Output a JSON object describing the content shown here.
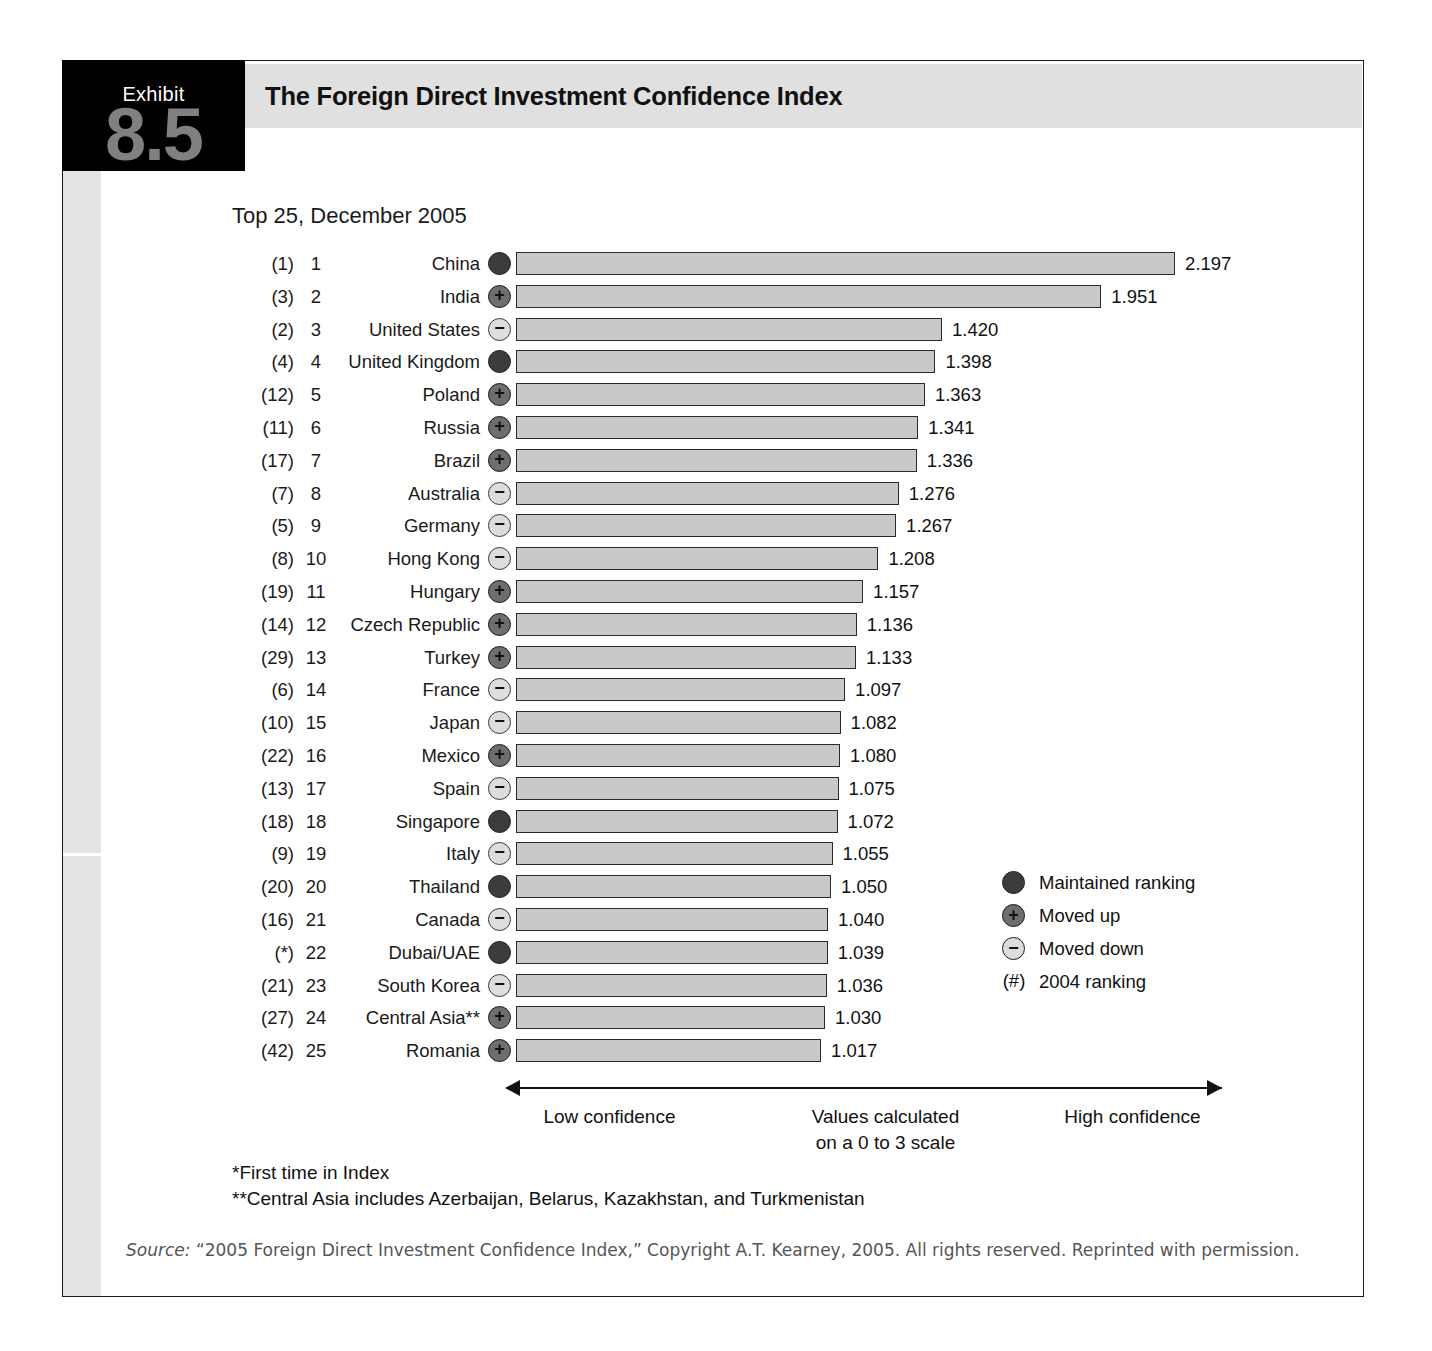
{
  "exhibit": {
    "label": "Exhibit",
    "number": "8.5",
    "title": "The Foreign Direct Investment Confidence Index"
  },
  "subtitle": "Top 25, December 2005",
  "legend": [
    {
      "icon": "filled-circle-icon",
      "type": "same",
      "glyph": "",
      "text": "Maintained ranking"
    },
    {
      "icon": "plus-circle-icon",
      "type": "up",
      "glyph": "+",
      "text": "Moved up"
    },
    {
      "icon": "minus-circle-icon",
      "type": "down",
      "glyph": "−",
      "text": "Moved down"
    },
    {
      "icon": "hash-paren-icon",
      "type": "hash",
      "glyph": "(#)",
      "text": "2004 ranking"
    }
  ],
  "axis": {
    "low": "Low confidence",
    "middle": "Values calculated\non a 0 to 3 scale",
    "middle_line1": "Values calculated",
    "middle_line2": "on a 0 to 3 scale",
    "high": "High confidence"
  },
  "footnotes": [
    "*First time in Index",
    "**Central Asia includes Azerbaijan, Belarus, Kazakhstan, and Turkmenistan"
  ],
  "source": "Source: “2005 Foreign Direct Investment Confidence Index,” Copyright A.T. Kearney, 2005. All rights reserved. Reprinted with permission.",
  "source_prefix": "Source:",
  "source_rest": " “2005 Foreign Direct Investment Confidence Index,” Copyright A.T. Kearney, 2005. All rights reserved. Reprinted with permission.",
  "chart_data": {
    "type": "bar",
    "orientation": "horizontal",
    "title": "The Foreign Direct Investment Confidence Index",
    "subtitle": "Top 25, December 2005",
    "xlabel": "Values calculated on a 0 to 3 scale",
    "ylabel": "",
    "xlim": [
      0,
      3
    ],
    "grid": false,
    "legend_position": "right",
    "categories": [
      "China",
      "India",
      "United States",
      "United Kingdom",
      "Poland",
      "Russia",
      "Brazil",
      "Australia",
      "Germany",
      "Hong Kong",
      "Hungary",
      "Czech Republic",
      "Turkey",
      "France",
      "Japan",
      "Mexico",
      "Spain",
      "Singapore",
      "Italy",
      "Thailand",
      "Canada",
      "Dubai/UAE",
      "South Korea",
      "Central Asia**",
      "Romania"
    ],
    "values": [
      2.197,
      1.951,
      1.42,
      1.398,
      1.363,
      1.341,
      1.336,
      1.276,
      1.267,
      1.208,
      1.157,
      1.136,
      1.133,
      1.097,
      1.082,
      1.08,
      1.075,
      1.072,
      1.055,
      1.05,
      1.04,
      1.039,
      1.036,
      1.03,
      1.017
    ],
    "rows": [
      {
        "prev": "(1)",
        "rank": "1",
        "country": "China",
        "marker": "same",
        "value": 2.197,
        "value_label": "2.197"
      },
      {
        "prev": "(3)",
        "rank": "2",
        "country": "India",
        "marker": "up",
        "value": 1.951,
        "value_label": "1.951"
      },
      {
        "prev": "(2)",
        "rank": "3",
        "country": "United States",
        "marker": "down",
        "value": 1.42,
        "value_label": "1.420"
      },
      {
        "prev": "(4)",
        "rank": "4",
        "country": "United Kingdom",
        "marker": "same",
        "value": 1.398,
        "value_label": "1.398"
      },
      {
        "prev": "(12)",
        "rank": "5",
        "country": "Poland",
        "marker": "up",
        "value": 1.363,
        "value_label": "1.363"
      },
      {
        "prev": "(11)",
        "rank": "6",
        "country": "Russia",
        "marker": "up",
        "value": 1.341,
        "value_label": "1.341"
      },
      {
        "prev": "(17)",
        "rank": "7",
        "country": "Brazil",
        "marker": "up",
        "value": 1.336,
        "value_label": "1.336"
      },
      {
        "prev": "(7)",
        "rank": "8",
        "country": "Australia",
        "marker": "down",
        "value": 1.276,
        "value_label": "1.276"
      },
      {
        "prev": "(5)",
        "rank": "9",
        "country": "Germany",
        "marker": "down",
        "value": 1.267,
        "value_label": "1.267"
      },
      {
        "prev": "(8)",
        "rank": "10",
        "country": "Hong Kong",
        "marker": "down",
        "value": 1.208,
        "value_label": "1.208"
      },
      {
        "prev": "(19)",
        "rank": "11",
        "country": "Hungary",
        "marker": "up",
        "value": 1.157,
        "value_label": "1.157"
      },
      {
        "prev": "(14)",
        "rank": "12",
        "country": "Czech Republic",
        "marker": "up",
        "value": 1.136,
        "value_label": "1.136"
      },
      {
        "prev": "(29)",
        "rank": "13",
        "country": "Turkey",
        "marker": "up",
        "value": 1.133,
        "value_label": "1.133"
      },
      {
        "prev": "(6)",
        "rank": "14",
        "country": "France",
        "marker": "down",
        "value": 1.097,
        "value_label": "1.097"
      },
      {
        "prev": "(10)",
        "rank": "15",
        "country": "Japan",
        "marker": "down",
        "value": 1.082,
        "value_label": "1.082"
      },
      {
        "prev": "(22)",
        "rank": "16",
        "country": "Mexico",
        "marker": "up",
        "value": 1.08,
        "value_label": "1.080"
      },
      {
        "prev": "(13)",
        "rank": "17",
        "country": "Spain",
        "marker": "down",
        "value": 1.075,
        "value_label": "1.075"
      },
      {
        "prev": "(18)",
        "rank": "18",
        "country": "Singapore",
        "marker": "same",
        "value": 1.072,
        "value_label": "1.072"
      },
      {
        "prev": "(9)",
        "rank": "19",
        "country": "Italy",
        "marker": "down",
        "value": 1.055,
        "value_label": "1.055"
      },
      {
        "prev": "(20)",
        "rank": "20",
        "country": "Thailand",
        "marker": "same",
        "value": 1.05,
        "value_label": "1.050"
      },
      {
        "prev": "(16)",
        "rank": "21",
        "country": "Canada",
        "marker": "down",
        "value": 1.04,
        "value_label": "1.040"
      },
      {
        "prev": "(*)",
        "rank": "22",
        "country": "Dubai/UAE",
        "marker": "same",
        "value": 1.039,
        "value_label": "1.039"
      },
      {
        "prev": "(21)",
        "rank": "23",
        "country": "South Korea",
        "marker": "down",
        "value": 1.036,
        "value_label": "1.036"
      },
      {
        "prev": "(27)",
        "rank": "24",
        "country": "Central Asia**",
        "marker": "up",
        "value": 1.03,
        "value_label": "1.030"
      },
      {
        "prev": "(42)",
        "rank": "25",
        "country": "Romania",
        "marker": "up",
        "value": 1.017,
        "value_label": "1.017"
      }
    ]
  }
}
